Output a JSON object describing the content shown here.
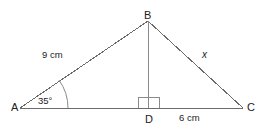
{
  "diagram": {
    "type": "triangle-with-altitude",
    "stroke_color": "#6b6b6b",
    "text_color": "#222222",
    "background_color": "#ffffff",
    "vertices": [
      {
        "name": "A",
        "label": "A",
        "x": 20,
        "y": 108
      },
      {
        "name": "B",
        "label": "B",
        "x": 148,
        "y": 21
      },
      {
        "name": "C",
        "label": "C",
        "x": 243,
        "y": 108
      },
      {
        "name": "D",
        "label": "D",
        "x": 148,
        "y": 108
      }
    ],
    "segments": [
      {
        "name": "side-AB",
        "from": "A",
        "to": "B",
        "label": "9 cm"
      },
      {
        "name": "side-BC",
        "from": "B",
        "to": "C",
        "label": "x"
      },
      {
        "name": "side-AC",
        "from": "A",
        "to": "C",
        "label": ""
      },
      {
        "name": "altitude-BD",
        "from": "B",
        "to": "D",
        "label": ""
      },
      {
        "name": "segment-DC",
        "from": "D",
        "to": "C",
        "label": "6 cm"
      }
    ],
    "angles": [
      {
        "name": "angle-at-A",
        "vertex": "A",
        "label": "35°",
        "value": 35,
        "unit": "degrees",
        "mark": "arc"
      },
      {
        "name": "angle-at-D",
        "vertex": "D",
        "label": "",
        "value": 90,
        "unit": "degrees",
        "mark": "right-angle-square"
      }
    ],
    "labels": {
      "vertex_a": "A",
      "vertex_b": "B",
      "vertex_c": "C",
      "vertex_d": "D",
      "side_ab": "9 cm",
      "side_bc": "x",
      "segment_dc": "6 cm",
      "angle_a": "35°"
    }
  }
}
